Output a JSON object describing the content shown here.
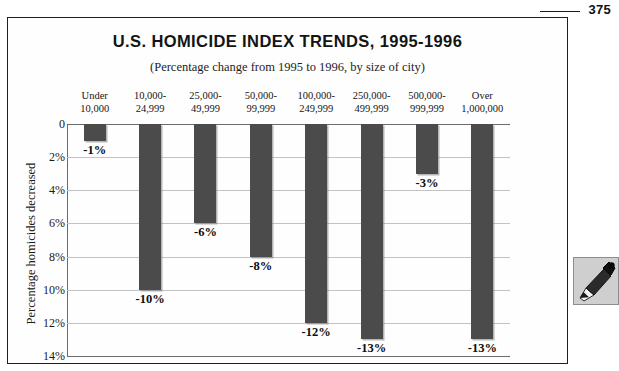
{
  "page": {
    "folio": "375"
  },
  "figure": {
    "title": "U.S. HOMICIDE INDEX TRENDS, 1995-1996",
    "subtitle": "(Percentage change from 1995 to 1996, by size of city)"
  },
  "margin_icon": {
    "name": "pen-icon",
    "label": "pen"
  },
  "chart_data": {
    "type": "bar",
    "title": "U.S. HOMICIDE INDEX TRENDS, 1995-1996",
    "subtitle": "(Percentage change from 1995 to 1996, by size of city)",
    "xlabel": "",
    "ylabel": "Percentage homicides decreased",
    "orientation": "vertical-downward",
    "grid": true,
    "legend": null,
    "bar_color": "#4b4b4b",
    "gridline_color": "#c3c3c3",
    "axis_color": "#6b6b6b",
    "ylim": [
      0,
      14
    ],
    "yticks": [
      0,
      2,
      4,
      6,
      8,
      10,
      12,
      14
    ],
    "ytick_labels": [
      "0",
      "2%",
      "4%",
      "6%",
      "8%",
      "10%",
      "12%",
      "14%"
    ],
    "categories": [
      "Under\n10,000",
      "10,000-\n24,999",
      "25,000-\n49,999",
      "50,000-\n99,999",
      "100,000-\n249,999",
      "250,000-\n499,999",
      "500,000-\n999,999",
      "Over\n1,000,000"
    ],
    "category_lines": [
      [
        "Under",
        "10,000"
      ],
      [
        "10,000-",
        "24,999"
      ],
      [
        "25,000-",
        "49,999"
      ],
      [
        "50,000-",
        "99,999"
      ],
      [
        "100,000-",
        "249,999"
      ],
      [
        "250,000-",
        "499,999"
      ],
      [
        "500,000-",
        "999,999"
      ],
      [
        "Over",
        "1,000,000"
      ]
    ],
    "values": [
      -1,
      -10,
      -6,
      -8,
      -12,
      -13,
      -3,
      -13
    ],
    "magnitudes": [
      1,
      10,
      6,
      8,
      12,
      13,
      3,
      13
    ],
    "data_labels": [
      "-1%",
      "-10%",
      "-6%",
      "-8%",
      "-12%",
      "-13%",
      "-3%",
      "-13%"
    ]
  }
}
